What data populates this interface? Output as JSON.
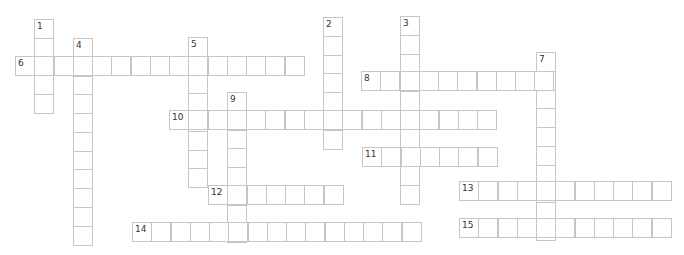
{
  "puzzle": {
    "cell_width": 19.25,
    "cell_height": 18.75,
    "border_color": "#c6c6c6",
    "words": [
      {
        "number": "1",
        "direction": "down",
        "x": 34,
        "y": 19,
        "length": 5
      },
      {
        "number": "2",
        "direction": "down",
        "x": 323,
        "y": 17,
        "length": 7
      },
      {
        "number": "3",
        "direction": "down",
        "x": 400,
        "y": 16,
        "length": 10
      },
      {
        "number": "4",
        "direction": "down",
        "x": 73,
        "y": 38,
        "length": 11
      },
      {
        "number": "5",
        "direction": "down",
        "x": 188,
        "y": 37,
        "length": 8
      },
      {
        "number": "6",
        "direction": "across",
        "x": 15,
        "y": 56,
        "length": 15
      },
      {
        "number": "7",
        "direction": "down",
        "x": 536,
        "y": 52,
        "length": 10
      },
      {
        "number": "8",
        "direction": "across",
        "x": 361,
        "y": 71,
        "length": 10
      },
      {
        "number": "9",
        "direction": "down",
        "x": 227,
        "y": 92,
        "length": 8
      },
      {
        "number": "10",
        "direction": "across",
        "x": 169,
        "y": 110,
        "length": 17
      },
      {
        "number": "11",
        "direction": "across",
        "x": 362,
        "y": 147,
        "length": 7
      },
      {
        "number": "12",
        "direction": "across",
        "x": 208,
        "y": 185,
        "length": 7
      },
      {
        "number": "13",
        "direction": "across",
        "x": 459,
        "y": 181,
        "length": 11
      },
      {
        "number": "14",
        "direction": "across",
        "x": 132,
        "y": 222,
        "length": 15
      },
      {
        "number": "15",
        "direction": "across",
        "x": 459,
        "y": 218,
        "length": 11
      }
    ]
  }
}
